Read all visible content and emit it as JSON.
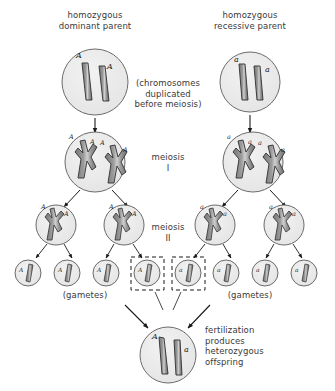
{
  "diagram": {
    "title_left": "homozygous\ndominant parent",
    "title_right": "homozygous\nrecessive parent",
    "note_duplication": "(chromosomes\nduplicated\nbefore meiosis)",
    "label_meiosis_1": "meiosis\nI",
    "label_meiosis_2": "meiosis\nII",
    "label_gametes_left": "(gametes)",
    "label_gametes_right": "(gametes)",
    "note_fertilization": "fertilization\nproduces\nheterozygous\noffspring",
    "alleles": {
      "dominant": "A",
      "recessive": "a"
    },
    "colors": {
      "cell_fill": "#ebebeb",
      "cell_stroke": "#6b6b6b",
      "chromosome_fill": "#8c8c8c",
      "chromosome_stroke": "#3d3d3d",
      "arrow": "#1a1a1a",
      "dashed_box": "#1a1a1a",
      "text": "#3a3a3a",
      "background": "#ffffff"
    },
    "left_parent_cell": {
      "alleles": [
        "A",
        "A"
      ],
      "chromosomes": 2,
      "replicated": false
    },
    "right_parent_cell": {
      "alleles": [
        "a",
        "a"
      ],
      "chromosomes": 2,
      "replicated": false
    },
    "left_duplicated_cell": {
      "alleles": [
        "A",
        "A",
        "A",
        "A"
      ],
      "chromosomes": 2,
      "replicated": true
    },
    "right_duplicated_cell": {
      "alleles": [
        "a",
        "a",
        "a",
        "a"
      ],
      "chromosomes": 2,
      "replicated": true
    },
    "left_meiosis1_cells": [
      {
        "alleles": [
          "A",
          "A"
        ],
        "chromosomes": 1,
        "replicated": true
      },
      {
        "alleles": [
          "A",
          "A"
        ],
        "chromosomes": 1,
        "replicated": true
      }
    ],
    "right_meiosis1_cells": [
      {
        "alleles": [
          "a",
          "a"
        ],
        "chromosomes": 1,
        "replicated": true
      },
      {
        "alleles": [
          "a",
          "a"
        ],
        "chromosomes": 1,
        "replicated": true
      }
    ],
    "left_gametes": [
      {
        "allele": "A",
        "selected": false
      },
      {
        "allele": "A",
        "selected": false
      },
      {
        "allele": "A",
        "selected": false
      },
      {
        "allele": "A",
        "selected": true
      }
    ],
    "right_gametes": [
      {
        "allele": "a",
        "selected": true
      },
      {
        "allele": "a",
        "selected": false
      },
      {
        "allele": "a",
        "selected": false
      },
      {
        "allele": "a",
        "selected": false
      }
    ],
    "offspring_cell": {
      "alleles": [
        "A",
        "a"
      ],
      "chromosomes": 2,
      "replicated": false,
      "genotype": "Aa"
    }
  }
}
